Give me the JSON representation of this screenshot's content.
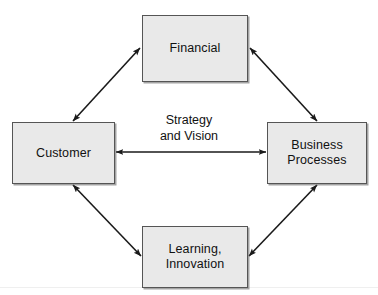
{
  "diagram": {
    "type": "cycle-diagram",
    "background_color": "#ffffff",
    "box_fill_color": "#e9e9e9",
    "box_border_color": "#555555",
    "arrow_color": "#1a1a1a",
    "center": {
      "label": "Strategy\nand Vision",
      "line1": "Strategy",
      "line2": "and Vision"
    },
    "nodes": [
      {
        "id": "financial",
        "label": "Financial",
        "position": "top"
      },
      {
        "id": "customer",
        "label": "Customer",
        "position": "left"
      },
      {
        "id": "business-processes",
        "label": "Business\nProcesses",
        "position": "right"
      },
      {
        "id": "learning-innovation",
        "label": "Learning,\nInnovation",
        "position": "bottom"
      }
    ],
    "connectors": [
      {
        "id": "customer-financial",
        "from": "customer",
        "to": "financial",
        "style": "double-headed-arrow"
      },
      {
        "id": "financial-business-processes",
        "from": "financial",
        "to": "business-processes",
        "style": "double-headed-arrow"
      },
      {
        "id": "customer-learning-innovation",
        "from": "customer",
        "to": "learning-innovation",
        "style": "double-headed-arrow"
      },
      {
        "id": "learning-innovation-business-processes",
        "from": "learning-innovation",
        "to": "business-processes",
        "style": "double-headed-arrow"
      },
      {
        "id": "customer-business-processes",
        "from": "customer",
        "to": "business-processes",
        "style": "double-headed-arrow"
      }
    ]
  }
}
